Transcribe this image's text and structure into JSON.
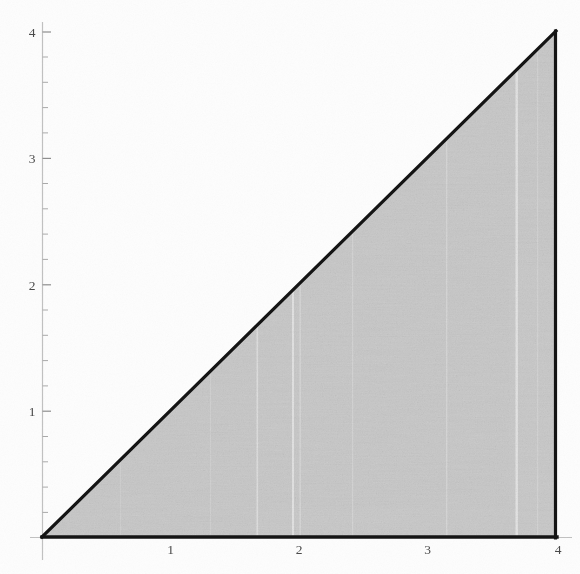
{
  "figure": {
    "title": "",
    "background_color": "#fdfdfd",
    "width": 580,
    "height": 574
  },
  "chart_data": {
    "type": "area",
    "title": "",
    "subtitle": "",
    "xlabel": "",
    "ylabel": "",
    "xlim": [
      0,
      4
    ],
    "ylim": [
      0,
      4
    ],
    "grid": false,
    "legend": null,
    "x_ticks": [
      0,
      1,
      2,
      3,
      4
    ],
    "x_tick_labels": [
      "",
      "1",
      "2",
      "3",
      "4"
    ],
    "y_ticks": [
      0,
      1,
      2,
      3,
      4
    ],
    "y_tick_labels": [
      "",
      "1",
      "2",
      "3",
      "4"
    ],
    "x_minor_step": 0.2,
    "y_minor_step": 0.2,
    "series": [
      {
        "name": "region y <= x",
        "type": "polygon",
        "closed": true,
        "fill_color": "#c9c9c9",
        "edge_color": "#141414",
        "edge_width": 3,
        "vertices": [
          [
            0,
            0
          ],
          [
            4,
            0
          ],
          [
            4,
            4
          ]
        ]
      },
      {
        "name": "boundary y = x",
        "type": "line",
        "x": [
          0,
          4
        ],
        "y": [
          0,
          4
        ],
        "color": "#141414",
        "width": 3
      }
    ],
    "annotations": [],
    "axis_color": "#b9b9b9",
    "tick_color": "#9a9a9a",
    "tick_label_color": "#4a4a4a"
  },
  "axes": {
    "x_axis": {
      "name": "x-axis",
      "labels": [
        {
          "value": 1,
          "text": "1"
        },
        {
          "value": 2,
          "text": "2"
        },
        {
          "value": 3,
          "text": "3"
        },
        {
          "value": 4,
          "text": "4"
        }
      ]
    },
    "y_axis": {
      "name": "y-axis",
      "labels": [
        {
          "value": 1,
          "text": "1"
        },
        {
          "value": 2,
          "text": "2"
        },
        {
          "value": 3,
          "text": "3"
        },
        {
          "value": 4,
          "text": "4"
        }
      ]
    }
  },
  "labels": {
    "x1": "1",
    "x2": "2",
    "x3": "3",
    "x4": "4",
    "y1": "1",
    "y2": "2",
    "y3": "3",
    "y4": "4"
  }
}
